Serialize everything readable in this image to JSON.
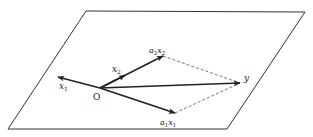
{
  "diagram": {
    "type": "vector-projection-plane",
    "plane": {
      "points": [
        [
          86,
          11
        ],
        [
          305,
          12
        ],
        [
          227,
          129
        ],
        [
          8,
          129
        ]
      ],
      "stroke": "#333333"
    },
    "origin": {
      "label": "O",
      "x": 100,
      "y": 88
    },
    "vectors": [
      {
        "name": "x1",
        "label_main": "x",
        "label_sub": "1",
        "from": [
          100,
          88
        ],
        "to": [
          58,
          77
        ],
        "label_pos": [
          60,
          89
        ]
      },
      {
        "name": "x2",
        "label_main": "x",
        "label_sub": "2",
        "from": [
          100,
          88
        ],
        "to": [
          125,
          75
        ],
        "label_pos": [
          114,
          72
        ]
      },
      {
        "name": "a2x2",
        "label_main": "a₂x₂",
        "label_sub": "",
        "from": [
          125,
          75
        ],
        "to": [
          163,
          56
        ],
        "label_pos": [
          150,
          53
        ]
      },
      {
        "name": "a1x1",
        "label_main": "a₁x₁",
        "label_sub": "",
        "from": [
          100,
          88
        ],
        "to": [
          175,
          113
        ],
        "label_pos": [
          160,
          125
        ]
      },
      {
        "name": "y",
        "label_main": "y",
        "label_sub": "",
        "from": [
          100,
          88
        ],
        "to": [
          240,
          83
        ],
        "label_pos": [
          245,
          80
        ]
      }
    ],
    "dashed_edges": [
      {
        "from": [
          163,
          56
        ],
        "to": [
          240,
          83
        ]
      },
      {
        "from": [
          175,
          113
        ],
        "to": [
          240,
          83
        ]
      }
    ],
    "labels": {
      "origin": "O",
      "x1": "x",
      "x1_sub": "1",
      "x2": "x",
      "x2_sub": "2",
      "a2x2_a": "a",
      "a2x2_asub": "2",
      "a2x2_x": "x",
      "a2x2_xsub": "2",
      "a1x1_a": "a",
      "a1x1_asub": "1",
      "a1x1_x": "x",
      "a1x1_xsub": "1",
      "y": "y"
    }
  }
}
